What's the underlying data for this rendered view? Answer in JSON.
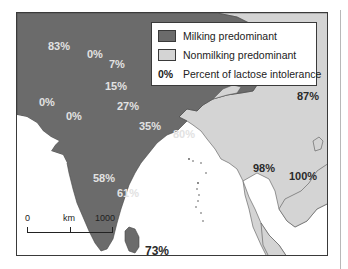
{
  "map": {
    "colors": {
      "milking": "#6b6b6b",
      "nonmilking": "#d4d4d4",
      "water": "#ffffff",
      "border": "#3a3a3a"
    },
    "legend": {
      "items": [
        {
          "type": "swatch",
          "color": "#6b6b6b",
          "label": "Milking predominant"
        },
        {
          "type": "swatch",
          "color": "#d4d4d4",
          "label": "Nonmilking predominant"
        },
        {
          "type": "text-key",
          "key": "0%",
          "label": "Percent of lactose intolerance"
        }
      ]
    },
    "labels": [
      {
        "text": "83%",
        "region": "milking",
        "x": 31,
        "y": 28
      },
      {
        "text": "0%",
        "region": "milking",
        "x": 70,
        "y": 36
      },
      {
        "text": "7%",
        "region": "milking",
        "x": 92,
        "y": 46
      },
      {
        "text": "15%",
        "region": "milking",
        "x": 88,
        "y": 68
      },
      {
        "text": "0%",
        "region": "milking",
        "x": 22,
        "y": 84
      },
      {
        "text": "0%",
        "region": "milking",
        "x": 49,
        "y": 98
      },
      {
        "text": "27%",
        "region": "milking",
        "x": 100,
        "y": 88
      },
      {
        "text": "35%",
        "region": "milking",
        "x": 122,
        "y": 108
      },
      {
        "text": "80%",
        "region": "milking",
        "x": 156,
        "y": 116
      },
      {
        "text": "87%",
        "region": "nonmilking",
        "x": 280,
        "y": 78
      },
      {
        "text": "58%",
        "region": "milking",
        "x": 76,
        "y": 160
      },
      {
        "text": "61%",
        "region": "milking",
        "x": 100,
        "y": 175
      },
      {
        "text": "98%",
        "region": "nonmilking",
        "x": 236,
        "y": 150
      },
      {
        "text": "100%",
        "region": "nonmilking",
        "x": 272,
        "y": 158
      },
      {
        "text": "73%",
        "region": "nonmilking-outside",
        "x": 128,
        "y": 232
      }
    ],
    "scale_bar": {
      "labels": [
        "0",
        "km",
        "1000"
      ]
    }
  }
}
